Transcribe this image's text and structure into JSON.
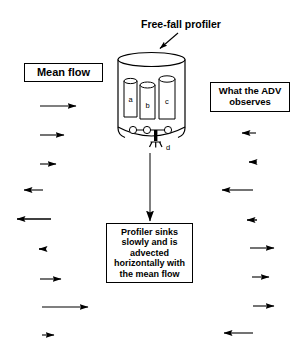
{
  "figure": {
    "title_label": "Free-fall profiler",
    "mean_flow_label": "Mean flow",
    "adv_label": "What the ADV\nobserves",
    "sink_label": "Profiler sinks\nslowly and is\nadvected\nhorizontally with\nthe mean flow",
    "stroke_color": "#000000",
    "background_color": "#ffffff"
  },
  "profiler": {
    "cylinder_labels": {
      "a": "a",
      "b": "b",
      "c": "c",
      "d": "d"
    }
  },
  "arrows": {
    "left_column_label": "mean-flow-arrows",
    "right_column_label": "adv-observed-arrows",
    "left": [
      {
        "y": 106,
        "x1": 40,
        "x2": 78,
        "dir": "right"
      },
      {
        "y": 135,
        "x1": 40,
        "x2": 66,
        "dir": "right"
      },
      {
        "y": 164,
        "x1": 40,
        "x2": 58,
        "dir": "right"
      },
      {
        "y": 190,
        "x1": 43,
        "x2": 22,
        "dir": "left"
      },
      {
        "y": 219,
        "x1": 51,
        "x2": 15,
        "dir": "left"
      },
      {
        "y": 249,
        "x1": 44,
        "x2": 37,
        "dir": "left"
      },
      {
        "y": 279,
        "x1": 40,
        "x2": 63,
        "dir": "right"
      },
      {
        "y": 307,
        "x1": 42,
        "x2": 90,
        "dir": "right"
      },
      {
        "y": 335,
        "x1": 42,
        "x2": 56,
        "dir": "right"
      }
    ],
    "right": [
      {
        "y": 133,
        "x1": 256,
        "x2": 240,
        "dir": "left"
      },
      {
        "y": 162,
        "x1": 257,
        "x2": 247,
        "dir": "left"
      },
      {
        "y": 190,
        "x1": 253,
        "x2": 220,
        "dir": "left"
      },
      {
        "y": 220,
        "x1": 257,
        "x2": 245,
        "dir": "left"
      },
      {
        "y": 248,
        "x1": 250,
        "x2": 276,
        "dir": "right"
      },
      {
        "y": 277,
        "x1": 252,
        "x2": 271,
        "dir": "right"
      },
      {
        "y": 306,
        "x1": 253,
        "x2": 276,
        "dir": "right"
      },
      {
        "y": 333,
        "x1": 253,
        "x2": 222,
        "dir": "left"
      }
    ],
    "sink_arrow": {
      "x": 150,
      "y1": 153,
      "y2": 222,
      "dir": "down"
    },
    "pointer_arrow": {
      "x1": 177,
      "y1": 34,
      "x2": 158,
      "y2": 50,
      "dir": "down-left"
    }
  }
}
